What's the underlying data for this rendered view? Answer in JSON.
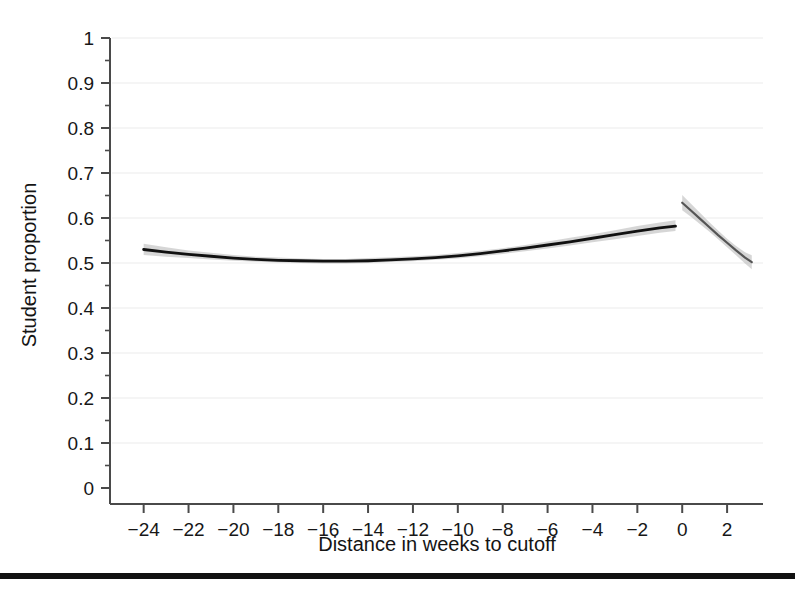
{
  "figure": {
    "background_color": "#ffffff",
    "axis_color": "#4a4a4a",
    "grid_color": "#ebebeb",
    "line_color": "#111111",
    "band_color": "#b4b4b4",
    "rule_color": "#111111"
  },
  "chart_data": {
    "type": "line",
    "title": "",
    "subtitle": "",
    "xlabel": "Distance in weeks to cutoff",
    "ylabel": "Student proportion",
    "xlim": [
      -25.5,
      3.6
    ],
    "ylim": [
      0,
      1
    ],
    "grid": true,
    "grid_axis": "y",
    "legend": "none",
    "cutoff_x": 0,
    "xticks": [
      -24,
      -22,
      -20,
      -18,
      -16,
      -14,
      -12,
      -10,
      -8,
      -6,
      -4,
      -2,
      0,
      2
    ],
    "xtick_labels": [
      "−24",
      "−22",
      "−20",
      "−18",
      "−16",
      "−14",
      "−12",
      "−10",
      "−8",
      "−6",
      "−4",
      "−2",
      "0",
      "2"
    ],
    "yticks": [
      0,
      0.1,
      0.2,
      0.3,
      0.4,
      0.5,
      0.6,
      0.7,
      0.8,
      0.9,
      1
    ],
    "ytick_labels": [
      "0",
      "0.1",
      "0.2",
      "0.3",
      "0.4",
      "0.5",
      "0.6",
      "0.7",
      "0.8",
      "0.9",
      "1"
    ],
    "yminor_ticks": [
      0.05,
      0.15,
      0.25,
      0.35,
      0.45,
      0.55,
      0.65,
      0.75,
      0.85,
      0.95
    ],
    "series": [
      {
        "name": "Fitted proportion (left of cutoff)",
        "side": "left",
        "x": [
          -24.0,
          -23.0,
          -22.0,
          -21.0,
          -20.0,
          -19.0,
          -18.0,
          -17.0,
          -16.0,
          -15.0,
          -14.0,
          -13.0,
          -12.0,
          -11.0,
          -10.0,
          -9.0,
          -8.0,
          -7.0,
          -6.0,
          -5.0,
          -4.0,
          -3.0,
          -2.0,
          -1.0,
          -0.3
        ],
        "values": [
          0.53,
          0.524,
          0.519,
          0.515,
          0.511,
          0.508,
          0.506,
          0.505,
          0.504,
          0.504,
          0.505,
          0.507,
          0.509,
          0.512,
          0.516,
          0.521,
          0.527,
          0.533,
          0.54,
          0.547,
          0.555,
          0.563,
          0.571,
          0.578,
          0.582
        ],
        "ci_low": [
          0.518,
          0.514,
          0.511,
          0.508,
          0.505,
          0.503,
          0.501,
          0.5,
          0.499,
          0.499,
          0.5,
          0.502,
          0.504,
          0.507,
          0.51,
          0.515,
          0.52,
          0.526,
          0.532,
          0.539,
          0.546,
          0.553,
          0.56,
          0.567,
          0.571
        ],
        "ci_high": [
          0.543,
          0.535,
          0.528,
          0.523,
          0.518,
          0.514,
          0.512,
          0.51,
          0.509,
          0.509,
          0.511,
          0.513,
          0.515,
          0.518,
          0.522,
          0.527,
          0.533,
          0.54,
          0.548,
          0.556,
          0.564,
          0.573,
          0.582,
          0.59,
          0.595
        ]
      },
      {
        "name": "Fitted proportion (right of cutoff)",
        "side": "right",
        "x": [
          0.0,
          0.4,
          0.8,
          1.2,
          1.6,
          2.0,
          2.4,
          2.8,
          3.1
        ],
        "values": [
          0.634,
          0.616,
          0.598,
          0.58,
          0.562,
          0.545,
          0.528,
          0.512,
          0.502
        ],
        "ci_low": [
          0.617,
          0.602,
          0.586,
          0.57,
          0.553,
          0.535,
          0.517,
          0.499,
          0.486
        ],
        "ci_high": [
          0.651,
          0.631,
          0.611,
          0.591,
          0.572,
          0.554,
          0.538,
          0.524,
          0.517
        ]
      }
    ],
    "annotations": {
      "discontinuity_jump": 0.052,
      "left_limit_at_cutoff": 0.582,
      "right_limit_at_cutoff": 0.634
    }
  }
}
